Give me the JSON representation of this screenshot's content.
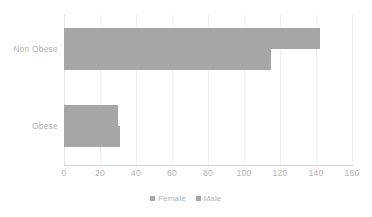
{
  "chart_data": {
    "type": "bar",
    "orientation": "horizontal",
    "title": "",
    "xlabel": "",
    "ylabel": "",
    "categories": [
      "Non Obese",
      "Obese"
    ],
    "series": [
      {
        "name": "Female",
        "values": [
          142,
          30
        ],
        "color": "#a6a6a6"
      },
      {
        "name": "Male",
        "values": [
          115,
          31
        ],
        "color": "#a6a6a6"
      }
    ],
    "xlim": [
      0,
      160
    ],
    "xticks": [
      0,
      20,
      40,
      60,
      80,
      100,
      120,
      140,
      160
    ],
    "xtick_labels": [
      "0",
      "20",
      "40",
      "60",
      "80",
      "100",
      "120",
      "140",
      "160"
    ],
    "grid": true,
    "grid_axis": "x",
    "legend": {
      "position": "bottom-center",
      "entries": [
        {
          "label": "Female",
          "color": "#a6a6a6"
        },
        {
          "label": "Male",
          "color": "#a6a6a6"
        }
      ]
    },
    "colors": {
      "bar": "#a6a6a6",
      "text": "#b3b3b3",
      "gridline": "#f0f0f0",
      "axis_line": "#d2d2d2",
      "background": "#ffffff"
    }
  }
}
